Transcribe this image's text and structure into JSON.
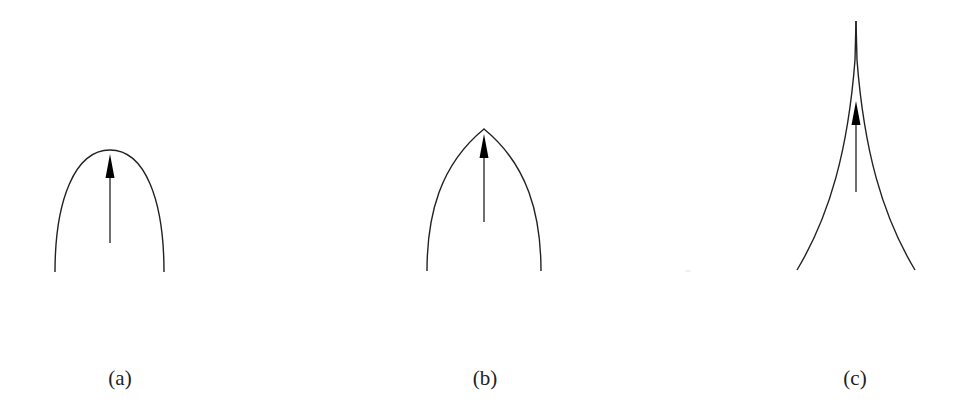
{
  "panels": [
    {
      "label": "(a)",
      "shape": "rounded-parabolic-front",
      "description": "smooth rounded tip with upward arrow"
    },
    {
      "label": "(b)",
      "shape": "pointed-cusp-front",
      "description": "sharp corner tip with upward arrow"
    },
    {
      "label": "(c)",
      "shape": "concave-needle-front",
      "description": "concave sides meeting in a thin needle tip with upward arrow"
    }
  ],
  "colors": {
    "stroke": "#222222",
    "arrow": "#000000",
    "background": "#ffffff"
  }
}
